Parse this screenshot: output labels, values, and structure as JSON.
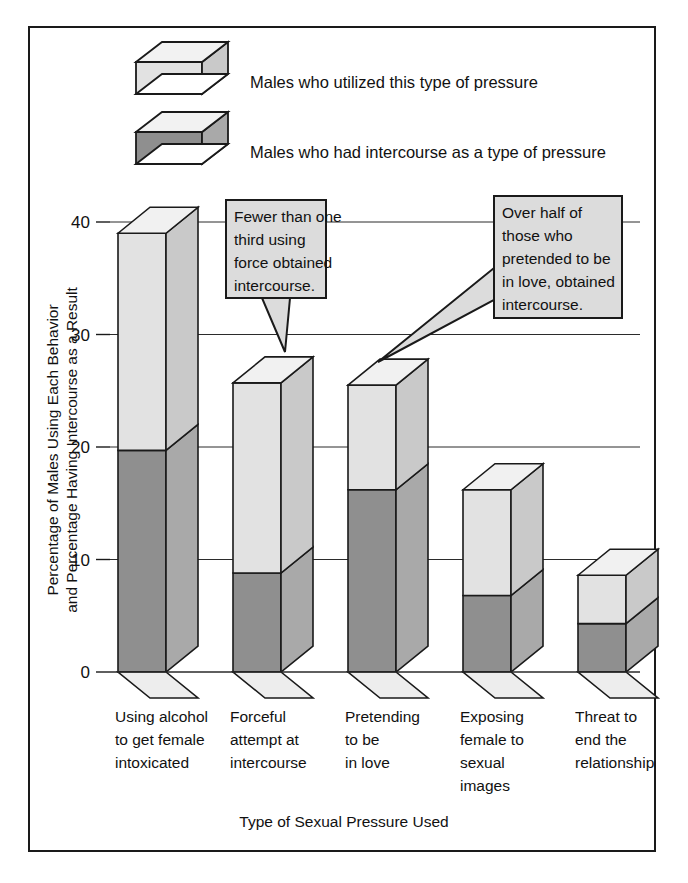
{
  "frame": {
    "background": "#ffffff",
    "border_color": "#1a1a1a"
  },
  "legend": {
    "position": "top-left",
    "items": [
      {
        "label": "Males who utilized this type of pressure",
        "swatch": "light-3d-box-icon",
        "front_color": "#e2e2e2",
        "side_color": "#c9c9c9",
        "top_color": "#f2f2f2"
      },
      {
        "label": "Males who had intercourse as a type of pressure",
        "swatch": "dark-3d-box-icon",
        "front_color": "#8f8f8f",
        "side_color": "#a9a9a9",
        "top_color": "#f2f2f2"
      }
    ]
  },
  "callouts": [
    {
      "name": "callout-force",
      "lines": [
        "Fewer than one",
        "third using",
        "force obtained",
        "intercourse."
      ],
      "fill": "#dcdcdc",
      "border": "#1a1a1a"
    },
    {
      "name": "callout-pretend",
      "lines": [
        "Over half of",
        "those who",
        "pretended to be",
        "in love, obtained",
        "intercourse."
      ],
      "fill": "#dcdcdc",
      "border": "#1a1a1a"
    }
  ],
  "chart_data": {
    "type": "bar",
    "title": "",
    "subtitle": "",
    "xlabel": "Type of Sexual Pressure Used",
    "ylabel": "Percentage of Males Using Each Behavior and Percentage Having Intercourse as a Result",
    "ylabel_lines": [
      "Percentage of Males Using Each Behavior",
      "and Percentage Having Intercourse as a Result"
    ],
    "ylim": [
      0,
      40
    ],
    "yticks": [
      0,
      10,
      20,
      30,
      40
    ],
    "ytick_labels": [
      "0",
      "10",
      "20",
      "30",
      "40"
    ],
    "grid": true,
    "grid_axis": "y",
    "legend_position": "top-left",
    "style": "3d-stacked-columns",
    "categories": [
      "Using alcohol to get female intoxicated",
      "Forceful attempt at intercourse",
      "Pretending to be in love",
      "Exposing female to sexual images",
      "Threat to end the relationship"
    ],
    "category_lines": [
      [
        "Using alcohol",
        "to get female",
        "intoxicated"
      ],
      [
        "Forceful",
        "attempt at",
        "intercourse"
      ],
      [
        "Pretending",
        "to be",
        "in love"
      ],
      [
        "Exposing",
        "female to",
        "sexual",
        "images"
      ],
      [
        "Threat to",
        "end the",
        "relationship"
      ]
    ],
    "series": [
      {
        "name": "Males who utilized this type of pressure",
        "key": "utilized",
        "color": "#e2e2e2",
        "values": [
          39.0,
          25.7,
          25.5,
          16.2,
          8.6
        ]
      },
      {
        "name": "Males who had intercourse as a type of pressure",
        "key": "intercourse",
        "color": "#8f8f8f",
        "values": [
          19.7,
          8.8,
          16.2,
          6.8,
          4.3
        ]
      }
    ],
    "annotations": [
      {
        "text": "Fewer than one third using force obtained intercourse.",
        "points_to_category": "Forceful attempt at intercourse"
      },
      {
        "text": "Over half of those who pretended to be in love, obtained intercourse.",
        "points_to_category": "Pretending to be in love"
      }
    ]
  }
}
